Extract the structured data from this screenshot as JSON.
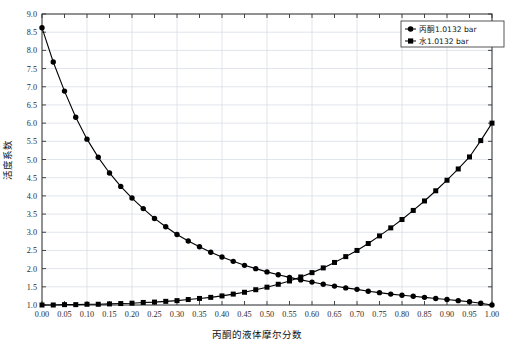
{
  "chart_data": {
    "type": "line",
    "title": "",
    "xlabel": "丙酮的液体摩尔分数",
    "ylabel": "活度系数",
    "xlim": [
      0.0,
      1.0
    ],
    "ylim": [
      1.0,
      9.0
    ],
    "grid": true,
    "legend_position": "top-right",
    "xticks": [
      "0.00",
      "0.05",
      "0.10",
      "0.15",
      "0.20",
      "0.25",
      "0.30",
      "0.35",
      "0.40",
      "0.45",
      "0.50",
      "0.55",
      "0.60",
      "0.65",
      "0.70",
      "0.75",
      "0.80",
      "0.85",
      "0.90",
      "0.95",
      "1.00"
    ],
    "yticks": [
      "1.0",
      "1.5",
      "2.0",
      "2.5",
      "3.0",
      "3.5",
      "4.0",
      "4.5",
      "5.0",
      "5.5",
      "6.0",
      "6.5",
      "7.0",
      "7.5",
      "8.0",
      "8.5",
      "9.0"
    ],
    "x": [
      0.0,
      0.025,
      0.05,
      0.075,
      0.1,
      0.125,
      0.15,
      0.175,
      0.2,
      0.225,
      0.25,
      0.275,
      0.3,
      0.325,
      0.35,
      0.375,
      0.4,
      0.425,
      0.45,
      0.475,
      0.5,
      0.525,
      0.55,
      0.575,
      0.6,
      0.625,
      0.65,
      0.675,
      0.7,
      0.725,
      0.75,
      0.775,
      0.8,
      0.825,
      0.85,
      0.875,
      0.9,
      0.925,
      0.95,
      0.975,
      1.0
    ],
    "series": [
      {
        "name": "丙酮1.0132 bar",
        "marker": "circle",
        "color": "#000000",
        "values": [
          8.62,
          7.68,
          6.88,
          6.16,
          5.56,
          5.06,
          4.63,
          4.26,
          3.94,
          3.65,
          3.38,
          3.15,
          2.94,
          2.76,
          2.6,
          2.45,
          2.32,
          2.2,
          2.09,
          2.0,
          1.91,
          1.83,
          1.76,
          1.69,
          1.63,
          1.57,
          1.52,
          1.47,
          1.43,
          1.38,
          1.34,
          1.3,
          1.27,
          1.24,
          1.21,
          1.18,
          1.15,
          1.12,
          1.09,
          1.05,
          1.0
        ]
      },
      {
        "name": "水1.0132 bar",
        "marker": "square",
        "color": "#000000",
        "values": [
          1.0,
          1.0,
          1.01,
          1.01,
          1.02,
          1.02,
          1.03,
          1.04,
          1.05,
          1.07,
          1.08,
          1.1,
          1.12,
          1.15,
          1.18,
          1.21,
          1.25,
          1.3,
          1.35,
          1.42,
          1.49,
          1.57,
          1.66,
          1.77,
          1.89,
          2.02,
          2.17,
          2.33,
          2.5,
          2.69,
          2.9,
          3.12,
          3.35,
          3.6,
          3.86,
          4.14,
          4.43,
          4.74,
          5.07,
          5.52,
          6.0
        ]
      }
    ]
  },
  "legend": {
    "items": [
      {
        "label": "丙酮1.0132 bar",
        "marker": "circle"
      },
      {
        "label": "水1.0132 bar",
        "marker": "square"
      }
    ]
  }
}
